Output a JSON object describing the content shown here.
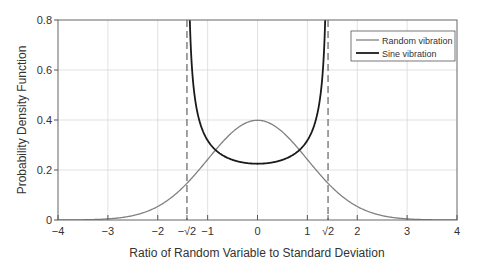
{
  "chart_data": {
    "type": "line",
    "title": "",
    "xlabel": "Ratio of Random Variable to Standard Deviation",
    "ylabel": "Probability Density Function",
    "xlim": [
      -4,
      4
    ],
    "ylim": [
      0,
      0.8
    ],
    "grid": true,
    "legend_position": "upper right",
    "x_ticks": [
      {
        "value": -4,
        "label": "−4"
      },
      {
        "value": -3,
        "label": "−3"
      },
      {
        "value": -2,
        "label": "−2"
      },
      {
        "value": -1.41421,
        "label": "−√2"
      },
      {
        "value": -1,
        "label": "−1"
      },
      {
        "value": 0,
        "label": "0"
      },
      {
        "value": 1,
        "label": "1"
      },
      {
        "value": 1.41421,
        "label": "√2"
      },
      {
        "value": 2,
        "label": "2"
      },
      {
        "value": 3,
        "label": "3"
      },
      {
        "value": 4,
        "label": "4"
      }
    ],
    "y_ticks": [
      {
        "value": 0,
        "label": "0"
      },
      {
        "value": 0.2,
        "label": "0.2"
      },
      {
        "value": 0.4,
        "label": "0.4"
      },
      {
        "value": 0.6,
        "label": "0.6"
      },
      {
        "value": 0.8,
        "label": "0.8"
      }
    ],
    "reference_lines": [
      {
        "orientation": "vertical",
        "x": -1.41421,
        "style": "dashed"
      },
      {
        "orientation": "vertical",
        "x": 1.41421,
        "style": "dashed"
      }
    ],
    "series": [
      {
        "name": "Random vibration",
        "color": "#808080",
        "width": 1.3,
        "x": [
          -4,
          -3.5,
          -3,
          -2.5,
          -2,
          -1.5,
          -1,
          -0.5,
          0,
          0.5,
          1,
          1.5,
          2,
          2.5,
          3,
          3.5,
          4
        ],
        "values": [
          0.0001,
          0.0009,
          0.0044,
          0.0175,
          0.054,
          0.1295,
          0.242,
          0.352,
          0.399,
          0.352,
          0.242,
          0.1295,
          0.054,
          0.0175,
          0.0044,
          0.0009,
          0.0001
        ]
      },
      {
        "name": "Sine vibration",
        "color": "#1a1a1a",
        "width": 1.8,
        "x": [
          -1.4,
          -1.35,
          -1.3,
          -1.2,
          -1.0,
          -0.8,
          -0.6,
          -0.4,
          -0.2,
          0,
          0.2,
          0.4,
          0.6,
          0.8,
          1.0,
          1.2,
          1.3,
          1.35,
          1.4
        ],
        "values": [
          1.59,
          0.755,
          0.567,
          0.425,
          0.318,
          0.273,
          0.25,
          0.235,
          0.227,
          0.225,
          0.227,
          0.235,
          0.25,
          0.273,
          0.318,
          0.425,
          0.567,
          0.755,
          1.59
        ]
      }
    ]
  },
  "legend": {
    "items": [
      {
        "label": "Random vibration"
      },
      {
        "label": "Sine vibration"
      }
    ]
  }
}
